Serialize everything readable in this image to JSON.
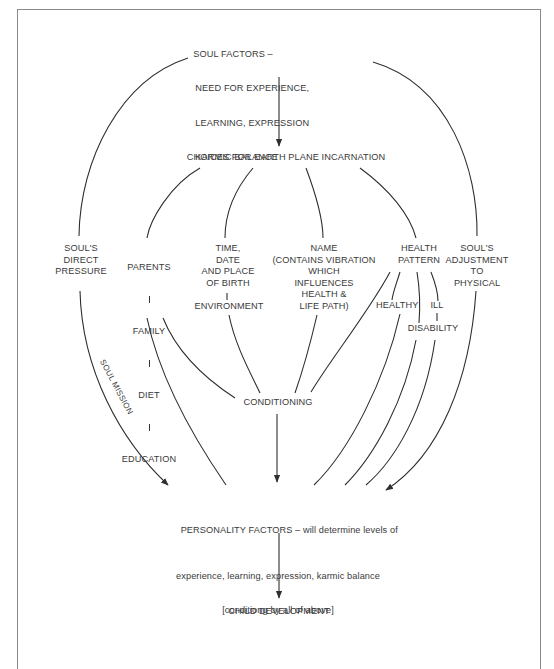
{
  "diagram": {
    "nodes": {
      "soul_factors": {
        "prefix": "SOUL FACTORS –",
        "lines": [
          "NEED FOR EXPERIENCE,",
          "LEARNING, EXPRESSION",
          "KARMIC BALANCE"
        ]
      },
      "choices": "CHOICES FOR EARTH PLANE INCARNATION",
      "souls_direct_pressure": "SOUL'S\nDIRECT\nPRESSURE",
      "parents_chain": [
        "PARENTS",
        "FAMILY",
        "DIET",
        "EDUCATION"
      ],
      "time_date_place": "TIME,\nDATE\nAND PLACE\nOF BIRTH",
      "environment": "ENVIRONMENT",
      "name": "NAME\n(CONTAINS VIBRATION\nWHICH\nINFLUENCES\nHEALTH &\nLIFE PATH)",
      "health_pattern": "HEALTH\nPATTERN",
      "healthy": "HEALTHY",
      "ill": "ILL",
      "disability": "DISABILITY",
      "souls_adjustment": "SOUL'S\nADJUSTMENT\nTO\nPHYSICAL",
      "conditioning": "CONDITIONING",
      "personality_factors": {
        "title": "PERSONALITY FACTORS",
        "line1_rest": " – will determine levels of",
        "line2": "experience, learning, expression, karmic balance",
        "line3": "[conditiong by all of above]"
      },
      "child_development": "CHILD DEVELOPMENT"
    },
    "edge_labels": {
      "soul_mission": "SOUL MISSION"
    },
    "edges": [
      {
        "from": "soul_factors",
        "to": "choices",
        "arrow": true
      },
      {
        "from": "soul_factors",
        "to": "souls_direct_pressure",
        "arrow": false
      },
      {
        "from": "soul_factors",
        "to": "souls_adjustment",
        "arrow": false
      },
      {
        "from": "choices",
        "to": "parents_chain",
        "arrow": false
      },
      {
        "from": "choices",
        "to": "time_date_place",
        "arrow": false
      },
      {
        "from": "choices",
        "to": "name",
        "arrow": false
      },
      {
        "from": "choices",
        "to": "health_pattern",
        "arrow": false
      },
      {
        "from": "time_date_place",
        "to": "environment",
        "arrow": false
      },
      {
        "from": "health_pattern",
        "to": "healthy",
        "arrow": false
      },
      {
        "from": "health_pattern",
        "to": "ill",
        "arrow": false
      },
      {
        "from": "health_pattern",
        "to": "disability",
        "arrow": false
      },
      {
        "from": "health_pattern",
        "to": "conditioning",
        "arrow": false
      },
      {
        "from": "ill",
        "to": "disability",
        "arrow": false
      },
      {
        "from": "education",
        "to": "conditioning",
        "arrow": false
      },
      {
        "from": "environment",
        "to": "conditioning",
        "arrow": false
      },
      {
        "from": "name",
        "to": "conditioning",
        "arrow": false
      },
      {
        "from": "souls_direct_pressure",
        "to": "personality_factors",
        "arrow": true,
        "label": "SOUL MISSION"
      },
      {
        "from": "education",
        "to": "personality_factors",
        "arrow": false
      },
      {
        "from": "conditioning",
        "to": "personality_factors",
        "arrow": true
      },
      {
        "from": "healthy",
        "to": "personality_factors",
        "arrow": false
      },
      {
        "from": "disability",
        "to": "personality_factors",
        "arrow": false
      },
      {
        "from": "ill",
        "to": "personality_factors",
        "arrow": false
      },
      {
        "from": "souls_adjustment",
        "to": "personality_factors",
        "arrow": true
      },
      {
        "from": "personality_factors",
        "to": "child_development",
        "arrow": true
      }
    ],
    "colors": {
      "line": "#2e2e2e",
      "text": "#3a3a3a",
      "frame": "#8a8a8a",
      "background": "#ffffff"
    }
  }
}
